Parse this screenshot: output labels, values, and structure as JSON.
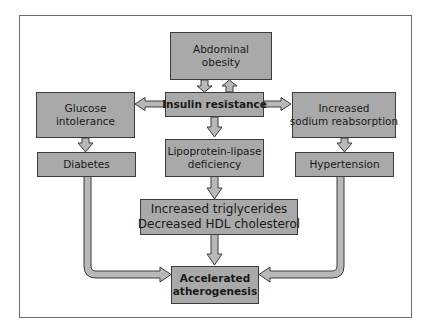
{
  "diagram": {
    "nodes": {
      "abdominal_obesity": {
        "line1": "Abdominal",
        "line2": "obesity"
      },
      "insulin_resistance": {
        "line1": "Insulin resistance"
      },
      "glucose_intolerance": {
        "line1": "Glucose",
        "line2": "intolerance"
      },
      "sodium_reabsorption": {
        "line1": "Increased",
        "line2": "sodium reabsorption"
      },
      "diabetes": {
        "line1": "Diabetes"
      },
      "lipoprotein_lipase": {
        "line1": "Lipoprotein-lipase",
        "line2": "deficiency"
      },
      "hypertension": {
        "line1": "Hypertension"
      },
      "lipids": {
        "line1": "Increased triglycerides",
        "line2": "Decreased HDL cholesterol"
      },
      "atherogenesis": {
        "line1": "Accelerated",
        "line2": "atherogenesis"
      }
    },
    "edges": [
      {
        "from": "abdominal_obesity",
        "to": "insulin_resistance"
      },
      {
        "from": "insulin_resistance",
        "to": "abdominal_obesity"
      },
      {
        "from": "insulin_resistance",
        "to": "glucose_intolerance"
      },
      {
        "from": "insulin_resistance",
        "to": "sodium_reabsorption"
      },
      {
        "from": "insulin_resistance",
        "to": "lipoprotein_lipase"
      },
      {
        "from": "glucose_intolerance",
        "to": "diabetes"
      },
      {
        "from": "sodium_reabsorption",
        "to": "hypertension"
      },
      {
        "from": "lipoprotein_lipase",
        "to": "lipids"
      },
      {
        "from": "lipids",
        "to": "atherogenesis"
      },
      {
        "from": "diabetes",
        "to": "atherogenesis"
      },
      {
        "from": "hypertension",
        "to": "atherogenesis"
      }
    ],
    "colors": {
      "box_fill": "#a9a9a9",
      "box_border": "#3c3c3c",
      "arrow_fill": "#b4b4b4",
      "frame": "#6a6a6a"
    }
  }
}
